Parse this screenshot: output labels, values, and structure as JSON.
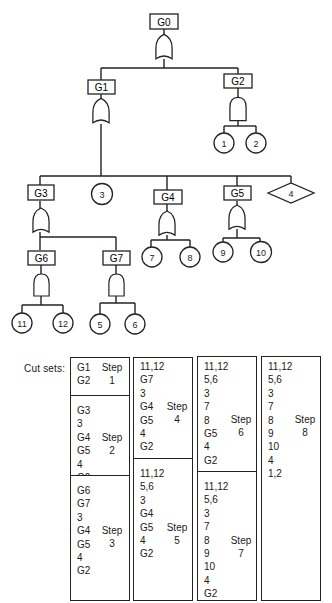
{
  "fault_tree": {
    "gates": [
      {
        "id": "G0",
        "type": "OR"
      },
      {
        "id": "G1",
        "type": "OR"
      },
      {
        "id": "G2",
        "type": "AND"
      },
      {
        "id": "G3",
        "type": "OR"
      },
      {
        "id": "G4",
        "type": "OR"
      },
      {
        "id": "G5",
        "type": "OR"
      },
      {
        "id": "G6",
        "type": "AND"
      },
      {
        "id": "G7",
        "type": "AND"
      }
    ],
    "basic_events": [
      "1",
      "2",
      "3",
      "5",
      "6",
      "7",
      "8",
      "9",
      "10",
      "11",
      "12"
    ],
    "undeveloped_events": [
      "4"
    ],
    "labels": {
      "G0": "G0",
      "G1": "G1",
      "G2": "G2",
      "G3": "G3",
      "G4": "G4",
      "G5": "G5",
      "G6": "G6",
      "G7": "G7",
      "e1": "1",
      "e2": "2",
      "e3": "3",
      "e4": "4",
      "e5": "5",
      "e6": "6",
      "e7": "7",
      "e8": "8",
      "e9": "9",
      "e10": "10",
      "e11": "11",
      "e12": "12"
    }
  },
  "cut_sets": {
    "label": "Cut sets:",
    "step_word": "Step",
    "steps": [
      {
        "number": "1",
        "items": [
          "G1",
          "G2"
        ]
      },
      {
        "number": "2",
        "items": [
          "G3",
          "3",
          "G4",
          "G5",
          "4",
          "G2"
        ]
      },
      {
        "number": "3",
        "items": [
          "G6",
          "G7",
          "3",
          "G4",
          "G5",
          "4",
          "G2"
        ]
      },
      {
        "number": "4",
        "items": [
          "11,12",
          "G7",
          "3",
          "G4",
          "G5",
          "4",
          "G2"
        ]
      },
      {
        "number": "5",
        "items": [
          "11,12",
          "5,6",
          "3",
          "G4",
          "G5",
          "4",
          "G2"
        ]
      },
      {
        "number": "6",
        "items": [
          "11,12",
          "5,6",
          "3",
          "7",
          "8",
          "G5",
          "4",
          "G2"
        ]
      },
      {
        "number": "7",
        "items": [
          "11,12",
          "5,6",
          "3",
          "7",
          "8",
          "9",
          "10",
          "4",
          "G2"
        ]
      },
      {
        "number": "8",
        "items": [
          "11,12",
          "5,6",
          "3",
          "7",
          "8",
          "9",
          "10",
          "4",
          "1,2"
        ]
      }
    ]
  }
}
